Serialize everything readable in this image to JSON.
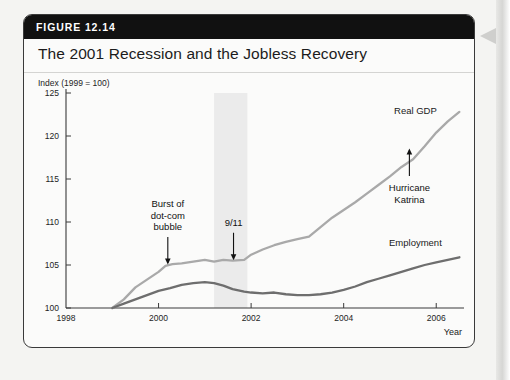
{
  "figure": {
    "number_label": "FIGURE 12.14",
    "title": "The 2001 Recession and the Jobless Recovery"
  },
  "chart_data": {
    "type": "line",
    "title": "The 2001 Recession and the Jobless Recovery",
    "subtitle": "Index (1999 = 100)",
    "xlabel": "Year",
    "ylabel": "Index (1999 = 100)",
    "xlim": [
      1998,
      2006.6
    ],
    "ylim": [
      100,
      125
    ],
    "xticks": [
      1998,
      2000,
      2002,
      2004,
      2006
    ],
    "xtick_labels": [
      "1998",
      "2000",
      "2002",
      "2004",
      "2006"
    ],
    "yticks": [
      100,
      105,
      110,
      115,
      120,
      125
    ],
    "ytick_labels": [
      "100",
      "105",
      "110",
      "115",
      "120",
      "125"
    ],
    "grid": false,
    "legend": "inline-series-labels",
    "colors": {
      "real_gdp": "#a9a9a9",
      "employment": "#6e6e6e",
      "recession_band": "#ebebeb",
      "axis": "#3a3a3a",
      "header_bar": "#111111",
      "card_background": "#fbfbfa"
    },
    "shaded_regions": [
      {
        "name": "2001 recession",
        "x0": 2001.2,
        "x1": 2001.92,
        "color": "#ebebeb"
      }
    ],
    "series": [
      {
        "name": "Real GDP",
        "color": "#a9a9a9",
        "x": [
          1999.0,
          1999.25,
          1999.5,
          1999.75,
          2000.0,
          2000.15,
          2000.3,
          2000.5,
          2000.75,
          2001.0,
          2001.2,
          2001.4,
          2001.6,
          2001.85,
          2002.0,
          2002.25,
          2002.5,
          2002.75,
          2003.0,
          2003.25,
          2003.5,
          2003.75,
          2004.0,
          2004.25,
          2004.5,
          2004.75,
          2005.0,
          2005.25,
          2005.5,
          2005.75,
          2006.0,
          2006.25,
          2006.5
        ],
        "y": [
          100.0,
          101.0,
          102.4,
          103.3,
          104.2,
          104.9,
          105.1,
          105.2,
          105.4,
          105.6,
          105.4,
          105.6,
          105.5,
          105.6,
          106.2,
          106.8,
          107.3,
          107.7,
          108.0,
          108.3,
          109.4,
          110.5,
          111.4,
          112.3,
          113.3,
          114.3,
          115.3,
          116.4,
          117.3,
          118.8,
          120.4,
          121.7,
          122.8
        ]
      },
      {
        "name": "Employment",
        "color": "#6e6e6e",
        "x": [
          1999.0,
          1999.25,
          1999.5,
          1999.75,
          2000.0,
          2000.25,
          2000.5,
          2000.75,
          2001.0,
          2001.2,
          2001.4,
          2001.6,
          2001.85,
          2002.0,
          2002.25,
          2002.5,
          2002.75,
          2003.0,
          2003.25,
          2003.5,
          2003.75,
          2004.0,
          2004.25,
          2004.5,
          2004.75,
          2005.0,
          2005.25,
          2005.5,
          2005.75,
          2006.0,
          2006.25,
          2006.5
        ],
        "y": [
          100.0,
          100.5,
          101.0,
          101.5,
          102.0,
          102.3,
          102.7,
          102.9,
          103.0,
          102.9,
          102.6,
          102.2,
          101.9,
          101.8,
          101.7,
          101.8,
          101.6,
          101.5,
          101.5,
          101.6,
          101.8,
          102.1,
          102.5,
          103.0,
          103.4,
          103.8,
          104.2,
          104.6,
          105.0,
          105.3,
          105.6,
          105.9
        ]
      }
    ],
    "annotations": [
      {
        "text": "Burst of\ndot-com\nbubble",
        "lines": [
          "Burst of",
          "dot-com",
          "bubble"
        ],
        "x": 2000.2,
        "y": 105.0,
        "arrow": "down"
      },
      {
        "text": "9/11",
        "lines": [
          "9/11"
        ],
        "x": 2001.62,
        "y": 105.5,
        "arrow": "down"
      },
      {
        "text": "Hurricane\nKatrina",
        "lines": [
          "Hurricane",
          "Katrina"
        ],
        "x": 2005.42,
        "y": 118.6,
        "arrow": "up"
      }
    ],
    "series_labels": [
      {
        "text": "Real GDP",
        "x": 2005.55,
        "y": 122.6
      },
      {
        "text": "Employment",
        "x": 2005.55,
        "y": 107.2
      }
    ]
  }
}
